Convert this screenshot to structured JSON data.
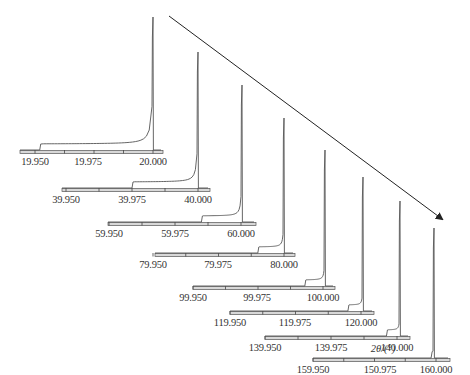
{
  "chart_data": {
    "type": "line",
    "title": "",
    "xlabel": "2θ/(°)",
    "ylabel": "",
    "grid": false,
    "legend": null,
    "arrow": {
      "from": [
        169,
        16
      ],
      "to": [
        442,
        219
      ],
      "meaning": "increasing 2θ"
    },
    "panels": [
      {
        "range": [
          19.95,
          20.0
        ],
        "ticks": [
          "19.950",
          "19.975",
          "20.000"
        ],
        "peak_at": 20.0,
        "step_at": 19.952
      },
      {
        "range": [
          39.95,
          40.0
        ],
        "ticks": [
          "39.950",
          "39.975",
          "40.000"
        ],
        "peak_at": 40.0,
        "step_at": 39.975
      },
      {
        "range": [
          59.95,
          60.0
        ],
        "ticks": [
          "59.950",
          "59.975",
          "60.000"
        ],
        "peak_at": 60.0,
        "step_at": 59.985
      },
      {
        "range": [
          79.95,
          80.0
        ],
        "ticks": [
          "79.950",
          "79.975",
          "80.000"
        ],
        "peak_at": 80.0,
        "step_at": 79.99
      },
      {
        "range": [
          99.95,
          100.0
        ],
        "ticks": [
          "99.950",
          "99.975",
          "100.000"
        ],
        "peak_at": 100.0,
        "step_at": 99.993
      },
      {
        "range": [
          119.95,
          120.0
        ],
        "ticks": [
          "119.950",
          "119.975",
          "120.000"
        ],
        "peak_at": 120.0,
        "step_at": 119.995
      },
      {
        "range": [
          139.95,
          140.0
        ],
        "ticks": [
          "139.950",
          "139.975",
          "140.000"
        ],
        "peak_at": 140.0,
        "step_at": 139.996
      },
      {
        "range": [
          159.95,
          160.0
        ],
        "ticks": [
          "159.950",
          "150.975",
          "160.000"
        ],
        "peak_at": 160.0,
        "step_at": 159.998
      }
    ]
  },
  "labels": {
    "axis_title": "2θ/(°)"
  }
}
